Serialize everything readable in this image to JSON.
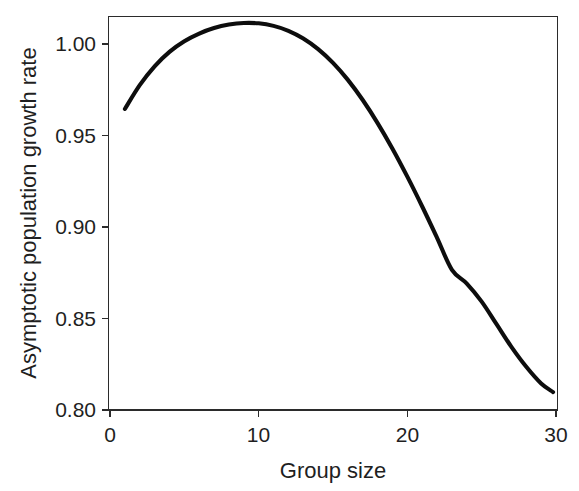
{
  "chart_data": {
    "type": "line",
    "title": "",
    "xlabel": "Group size",
    "ylabel": "Asymptotic population growth rate",
    "xlim": [
      0,
      30
    ],
    "ylim": [
      0.8,
      1.02
    ],
    "grid": false,
    "legend": null,
    "xticks": [
      0,
      10,
      20,
      30
    ],
    "xtick_labels": [
      "0",
      "10",
      "20",
      "30"
    ],
    "yticks": [
      0.8,
      0.85,
      0.9,
      0.95,
      1.0
    ],
    "ytick_labels": [
      "0.80",
      "0.85",
      "0.90",
      "0.95",
      "1.00"
    ],
    "series": [
      {
        "name": "asymptotic population growth rate",
        "color": "#0d0d0d",
        "x": [
          1,
          2,
          3,
          4,
          5,
          6,
          7,
          8,
          9,
          10,
          11,
          12,
          13,
          14,
          15,
          16,
          17,
          18,
          19,
          20,
          21,
          22,
          23,
          24,
          25,
          26,
          27,
          28,
          29,
          29.8
        ],
        "values": [
          0.9645,
          0.9775,
          0.9878,
          0.9957,
          1.0015,
          1.0057,
          1.0087,
          1.0106,
          1.0115,
          1.0113,
          1.0099,
          1.0072,
          1.003,
          0.9972,
          0.9897,
          0.9804,
          0.9694,
          0.9568,
          0.9428,
          0.9275,
          0.9112,
          0.8941,
          0.8766,
          0.8691,
          0.8592,
          0.8469,
          0.8345,
          0.8236,
          0.8145,
          0.8098
        ]
      }
    ],
    "annotations": {
      "peak_x": 9,
      "peak_y": 1.0115,
      "start_x": 1,
      "start_y": 0.9645,
      "end_x": 29.8,
      "end_y": 0.8098
    }
  },
  "axes": {
    "x_title": "Group size",
    "y_title": "Asymptotic population growth rate",
    "x_tick_0": "0",
    "x_tick_1": "10",
    "x_tick_2": "20",
    "x_tick_3": "30",
    "y_tick_0": "0.80",
    "y_tick_1": "0.85",
    "y_tick_2": "0.90",
    "y_tick_3": "0.95",
    "y_tick_4": "1.00"
  },
  "style": {
    "background": "#ffffff",
    "frame_color": "#2b2b2b",
    "curve_color": "#0d0d0d",
    "text_color": "#1f1f1f"
  }
}
